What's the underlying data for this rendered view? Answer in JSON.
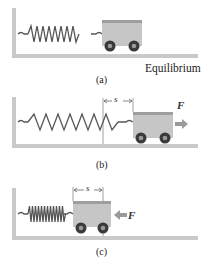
{
  "figure": {
    "panels": [
      {
        "id": "a",
        "caption": "(a)",
        "state_label": "Equilibrium"
      },
      {
        "id": "b",
        "caption": "(b)",
        "displacement_label": "s",
        "force_label": "F",
        "force_direction": "right"
      },
      {
        "id": "c",
        "caption": "(c)",
        "displacement_label": "s",
        "force_label": "F",
        "force_direction": "left"
      }
    ],
    "colors": {
      "wall_floor": "#c9c9c9",
      "cart_body": "#c6c6c6",
      "cart_rim": "#9e9e9e",
      "wheel": "#3a3a3a",
      "spring": "#555555",
      "arrow": "#9a9a9a"
    }
  }
}
